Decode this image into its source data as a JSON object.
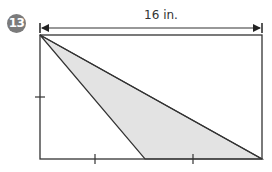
{
  "problem": {
    "number": "13"
  },
  "figure": {
    "type": "rectangle-with-shaded-triangle",
    "dimension_label": "16 in.",
    "dimension_side": "top",
    "colors": {
      "stroke": "#333333",
      "shade": "#e3e3e3",
      "badge": "#7b7b7b"
    },
    "tick_marks": {
      "left_side": 1,
      "bottom_side": 2
    },
    "rectangle": {
      "x": 40,
      "y": 35,
      "width": 222,
      "height": 124
    },
    "shaded_triangle": {
      "vertices": [
        [
          40,
          35
        ],
        [
          145,
          159
        ],
        [
          262,
          159
        ]
      ]
    }
  }
}
